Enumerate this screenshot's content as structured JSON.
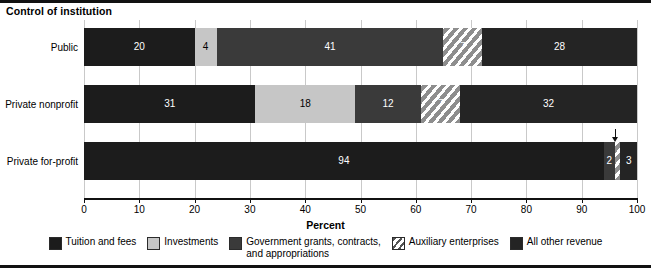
{
  "chart_data": {
    "type": "bar",
    "orientation": "horizontal",
    "stacked": true,
    "normalized_to_percent": true,
    "title": "Control of institution",
    "xlabel": "Percent",
    "ylabel": "",
    "xlim": [
      0,
      100
    ],
    "grid": true,
    "legend_position": "bottom",
    "categories": [
      "Public",
      "Private nonprofit",
      "Private for-profit"
    ],
    "tick_labels": [
      "0",
      "10",
      "20",
      "30",
      "40",
      "50",
      "60",
      "70",
      "80",
      "90",
      "100"
    ],
    "tick_values": [
      0,
      10,
      20,
      30,
      40,
      50,
      60,
      70,
      80,
      90,
      100
    ],
    "series": [
      {
        "name": "Tuition and fees",
        "color": "#1c1c1c",
        "values": [
          20,
          31,
          94
        ]
      },
      {
        "name": "Investments",
        "color": "#c6c6c6",
        "values": [
          4,
          18,
          0
        ]
      },
      {
        "name": "Government grants, contracts,\nand appropriations",
        "color": "#3a3a3a",
        "values": [
          41,
          12,
          2
        ]
      },
      {
        "name": "Auxiliary enterprises",
        "color": "hatched",
        "values": [
          7,
          7,
          1
        ]
      },
      {
        "name": "All other revenue",
        "color": "#242424",
        "values": [
          28,
          32,
          3
        ]
      }
    ],
    "rows": [
      {
        "label": "Public",
        "segments": [
          {
            "series": "Tuition and fees",
            "value": 20,
            "label": "20",
            "style": "tuition",
            "show_label": true
          },
          {
            "series": "Investments",
            "value": 4,
            "label": "4",
            "style": "invest",
            "show_label": true
          },
          {
            "series": "Government grants, contracts, and appropriations",
            "value": 41,
            "label": "41",
            "style": "govt",
            "show_label": true
          },
          {
            "series": "Auxiliary enterprises",
            "value": 7,
            "label": "7",
            "style": "aux",
            "show_label": true
          },
          {
            "series": "All other revenue",
            "value": 28,
            "label": "28",
            "style": "other",
            "show_label": true
          }
        ]
      },
      {
        "label": "Private nonprofit",
        "segments": [
          {
            "series": "Tuition and fees",
            "value": 31,
            "label": "31",
            "style": "tuition",
            "show_label": true
          },
          {
            "series": "Investments",
            "value": 18,
            "label": "18",
            "style": "invest",
            "show_label": true
          },
          {
            "series": "Government grants, contracts, and appropriations",
            "value": 12,
            "label": "12",
            "style": "govt",
            "show_label": true
          },
          {
            "series": "Auxiliary enterprises",
            "value": 7,
            "label": "7",
            "style": "aux",
            "show_label": true
          },
          {
            "series": "All other revenue",
            "value": 32,
            "label": "32",
            "style": "other",
            "show_label": true
          }
        ]
      },
      {
        "label": "Private for-profit",
        "segments": [
          {
            "series": "Tuition and fees",
            "value": 94,
            "label": "94",
            "style": "tuition",
            "show_label": true
          },
          {
            "series": "Government grants, contracts, and appropriations",
            "value": 2,
            "label": "2",
            "style": "govt",
            "show_label": true
          },
          {
            "series": "Auxiliary enterprises",
            "value": 1,
            "label": "",
            "style": "aux",
            "show_label": false
          },
          {
            "series": "All other revenue",
            "value": 3,
            "label": "3",
            "style": "other",
            "show_label": true
          }
        ],
        "annotation": {
          "kind": "arrow-pointer",
          "points_at_value": 96,
          "label": ""
        }
      }
    ]
  },
  "legend": {
    "items": [
      {
        "label": "Tuition and fees",
        "style": "tuition"
      },
      {
        "label": "Investments",
        "style": "invest"
      },
      {
        "label": "Government grants, contracts,\nand appropriations",
        "style": "govt"
      },
      {
        "label": "Auxiliary enterprises",
        "style": "aux"
      },
      {
        "label": "All other revenue",
        "style": "other"
      }
    ]
  }
}
